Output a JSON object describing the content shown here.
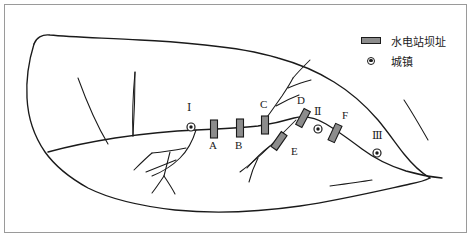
{
  "figure": {
    "type": "watershed-sketch-map",
    "width": 471,
    "height": 237,
    "background": "#ffffff",
    "frame_color": "#9a9a9a",
    "ink_color": "#1a1a1a",
    "dam_fill": "#8c8c8c"
  },
  "legend": {
    "items": [
      {
        "symbol": "dam-bar",
        "label": "水电站坝址"
      },
      {
        "symbol": "city-dot",
        "label": "城镇"
      }
    ]
  },
  "dams": [
    {
      "id": "A",
      "label": "A",
      "x": 214,
      "y": 129,
      "angle": 0,
      "label_x": 209,
      "label_y": 146
    },
    {
      "id": "B",
      "label": "B",
      "x": 240,
      "y": 128,
      "angle": 0,
      "label_x": 235,
      "label_y": 146
    },
    {
      "id": "C",
      "label": "C",
      "x": 265,
      "y": 125,
      "angle": 0,
      "label_x": 260,
      "label_y": 105
    },
    {
      "id": "D",
      "label": "D",
      "x": 303,
      "y": 118,
      "angle": 28,
      "label_x": 297,
      "label_y": 101
    },
    {
      "id": "E",
      "label": "E",
      "x": 279,
      "y": 141,
      "angle": 35,
      "label_x": 291,
      "label_y": 152
    },
    {
      "id": "F",
      "label": "F",
      "x": 335,
      "y": 133,
      "angle": 25,
      "label_x": 342,
      "label_y": 116
    }
  ],
  "cities": [
    {
      "id": "I",
      "label": "Ⅰ",
      "x": 191,
      "y": 127,
      "label_x": 186,
      "label_y": 108
    },
    {
      "id": "II",
      "label": "Ⅱ",
      "x": 318,
      "y": 129,
      "label_x": 313,
      "label_y": 112
    },
    {
      "id": "III",
      "label": "Ⅲ",
      "x": 377,
      "y": 153,
      "label_x": 372,
      "label_y": 136
    }
  ]
}
